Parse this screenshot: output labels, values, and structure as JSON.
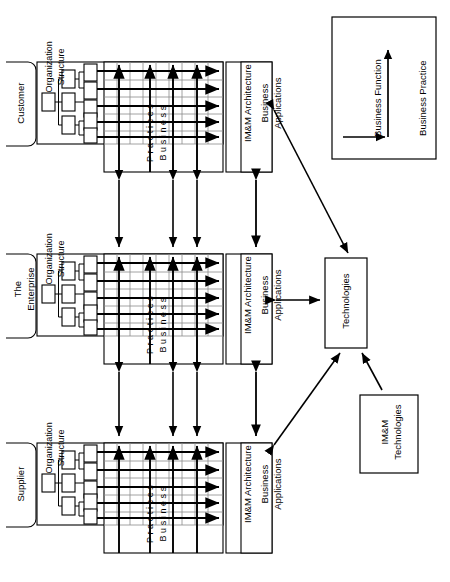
{
  "diagram": {
    "orientation": "rotated-90",
    "colors": {
      "stroke": "#000000",
      "fill": "#ffffff",
      "grid_light": "#888888"
    }
  },
  "panels": [
    {
      "id": "customer",
      "entity_label": "Customer",
      "org_label_line1": "Organization",
      "org_label_line2": "Structure",
      "matrix_label_line1": "Business",
      "matrix_label_line2": "Practices",
      "arch_label": "IM&M Architecture",
      "apps_label_line1": "Business",
      "apps_label_line2": "Applications",
      "tree": {
        "root_count": 1,
        "mid_count": 3,
        "leaf_count": 5
      },
      "matrix": {
        "rows": 5,
        "cols": 9,
        "function_arrows": 5,
        "practice_arrows": 4
      }
    },
    {
      "id": "enterprise",
      "entity_label_line1": "The",
      "entity_label_line2": "Enterprise",
      "org_label_line1": "Organization",
      "org_label_line2": "Structure",
      "matrix_label_line1": "Business",
      "matrix_label_line2": "Practices",
      "arch_label": "IM&M Architecture",
      "apps_label_line1": "Business",
      "apps_label_line2": "Applications",
      "tree": {
        "root_count": 1,
        "mid_count": 3,
        "leaf_count": 5
      },
      "matrix": {
        "rows": 5,
        "cols": 9,
        "function_arrows": 5,
        "practice_arrows": 4
      }
    },
    {
      "id": "supplier",
      "entity_label": "Supplier",
      "org_label_line1": "Organization",
      "org_label_line2": "Structure",
      "matrix_label_line1": "Business",
      "matrix_label_line2": "Practices",
      "arch_label": "IM&M Architecture",
      "apps_label_line1": "Business",
      "apps_label_line2": "Applications",
      "tree": {
        "root_count": 1,
        "mid_count": 3,
        "leaf_count": 5
      },
      "matrix": {
        "rows": 5,
        "cols": 9,
        "function_arrows": 5,
        "practice_arrows": 4
      }
    }
  ],
  "nodes": {
    "technologies": {
      "label": "Technologies"
    },
    "immtech": {
      "label_line1": "IM&M",
      "label_line2": "Technologies"
    }
  },
  "legend": {
    "function_label": "Business Function",
    "practice_label": "Business Practice"
  },
  "connectors": [
    {
      "name": "customer-to-enterprise",
      "type": "double-arrow",
      "count": 3
    },
    {
      "name": "enterprise-to-supplier",
      "type": "double-arrow",
      "count": 3
    },
    {
      "name": "customer-apps-to-enterprise-apps",
      "type": "double-arrow"
    },
    {
      "name": "enterprise-apps-to-supplier-apps",
      "type": "double-arrow"
    },
    {
      "name": "customer-apps-to-technologies",
      "type": "double-arrow"
    },
    {
      "name": "enterprise-apps-to-technologies",
      "type": "double-arrow"
    },
    {
      "name": "supplier-apps-to-technologies",
      "type": "double-arrow"
    },
    {
      "name": "immtech-to-technologies",
      "type": "single-arrow"
    }
  ]
}
